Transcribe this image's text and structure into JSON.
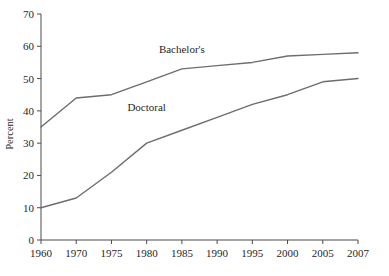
{
  "chart_data": {
    "type": "line",
    "title": "",
    "xlabel": "",
    "ylabel": "Percent",
    "ylim": [
      0,
      70
    ],
    "ytick_values": [
      0,
      10,
      20,
      30,
      40,
      50,
      60,
      70
    ],
    "ytick_labels": [
      "0",
      "10",
      "20",
      "30",
      "40",
      "50",
      "60",
      "70"
    ],
    "grid": false,
    "legend": "inline-labels",
    "categories": [
      "1960",
      "1970",
      "1975",
      "1980",
      "1985",
      "1990",
      "1995",
      "2000",
      "2005",
      "2007"
    ],
    "series": [
      {
        "name": "Bachelor's",
        "label": "Bachelor's",
        "color": "#6d6d6d",
        "values": [
          35,
          44,
          45,
          49,
          53,
          54,
          55,
          57,
          57.5,
          58
        ]
      },
      {
        "name": "Doctoral",
        "label": "Doctoral",
        "color": "#6d6d6d",
        "values": [
          10,
          13,
          21,
          30,
          34,
          38,
          42,
          45,
          49,
          50
        ]
      }
    ],
    "annotations": [
      {
        "text": "Bachelor's",
        "x_category": "1985",
        "value": 58
      },
      {
        "text": "Doctoral",
        "x_category": "1980",
        "value": 40
      }
    ]
  }
}
